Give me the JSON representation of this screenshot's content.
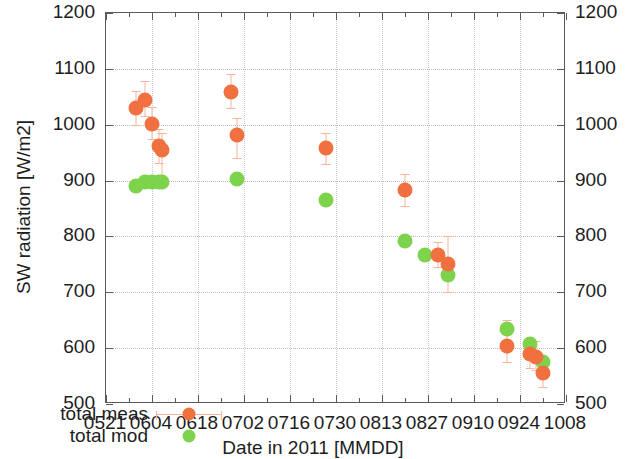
{
  "chart_data": {
    "type": "scatter",
    "title": "",
    "xlabel": "Date in 2011 [MMDD]",
    "ylabel": "SW radiation [W/m2]",
    "ylim": [
      500,
      1200
    ],
    "yticks": [
      500,
      600,
      700,
      800,
      900,
      1000,
      1100,
      1200
    ],
    "xticks": [
      "0521",
      "0604",
      "0618",
      "0702",
      "0716",
      "0730",
      "0813",
      "0827",
      "0910",
      "0924",
      "1008"
    ],
    "xlim": [
      "0521",
      "1008"
    ],
    "grid": true,
    "legend_position": "lower-left",
    "colors": {
      "meas": "#f0713f",
      "mod": "#7ed34c",
      "errorbar": "#f6b59a",
      "frame": "#5a5a5a",
      "gridline": "#c9b9b0"
    },
    "series": [
      {
        "name": "total meas",
        "marker": "circle",
        "color": "#f0713f",
        "points": [
          {
            "date": "0530",
            "value": 1030,
            "err_low": 1000,
            "err_high": 1060
          },
          {
            "date": "0602",
            "value": 1045,
            "err_low": 1015,
            "err_high": 1078
          },
          {
            "date": "0604",
            "value": 1002,
            "err_low": 975,
            "err_high": 1032
          },
          {
            "date": "0606",
            "value": 962,
            "err_low": 932,
            "err_high": 992
          },
          {
            "date": "0607",
            "value": 955,
            "err_low": 905,
            "err_high": 985
          },
          {
            "date": "0628",
            "value": 1059,
            "err_low": 1030,
            "err_high": 1090
          },
          {
            "date": "0630",
            "value": 982,
            "err_low": 940,
            "err_high": 1012
          },
          {
            "date": "0727",
            "value": 958,
            "err_low": 930,
            "err_high": 986
          },
          {
            "date": "0820",
            "value": 883,
            "err_low": 855,
            "err_high": 912
          },
          {
            "date": "0830",
            "value": 767,
            "err_low": 745,
            "err_high": 790
          },
          {
            "date": "0902",
            "value": 751,
            "err_low": 700,
            "err_high": 800
          },
          {
            "date": "0920",
            "value": 604,
            "err_low": 575,
            "err_high": 650
          },
          {
            "date": "0927",
            "value": 590,
            "err_low": 565,
            "err_high": 618
          },
          {
            "date": "0929",
            "value": 585,
            "err_low": 560,
            "err_high": 612
          },
          {
            "date": "0931",
            "value": 556,
            "err_low": 530,
            "err_high": 583
          }
        ]
      },
      {
        "name": "total mod",
        "marker": "circle",
        "color": "#7ed34c",
        "points": [
          {
            "date": "0530",
            "value": 890
          },
          {
            "date": "0602",
            "value": 897
          },
          {
            "date": "0604",
            "value": 898
          },
          {
            "date": "0606",
            "value": 898
          },
          {
            "date": "0607",
            "value": 897
          },
          {
            "date": "0630",
            "value": 903
          },
          {
            "date": "0727",
            "value": 866
          },
          {
            "date": "0820",
            "value": 791
          },
          {
            "date": "0826",
            "value": 766
          },
          {
            "date": "0902",
            "value": 731
          },
          {
            "date": "0920",
            "value": 635
          },
          {
            "date": "0927",
            "value": 607
          },
          {
            "date": "0931",
            "value": 576
          }
        ]
      }
    ]
  },
  "legend": {
    "items": [
      {
        "label": "total meas",
        "key": "meas"
      },
      {
        "label": "total mod",
        "key": "mod"
      }
    ]
  },
  "axes": {
    "y_left_labels": [
      "1200",
      "1100",
      "1000",
      "900",
      "800",
      "700",
      "600",
      "500"
    ],
    "y_right_labels": [
      "1200",
      "1100",
      "1000",
      "900",
      "800",
      "700",
      "600",
      "500"
    ],
    "x_labels": [
      "0521",
      "0604",
      "0618",
      "0702",
      "0716",
      "0730",
      "0813",
      "0827",
      "0910",
      "0924",
      "1008"
    ],
    "x_title": "Date in 2011 [MMDD]",
    "y_title": "SW radiation [W/m2]"
  }
}
